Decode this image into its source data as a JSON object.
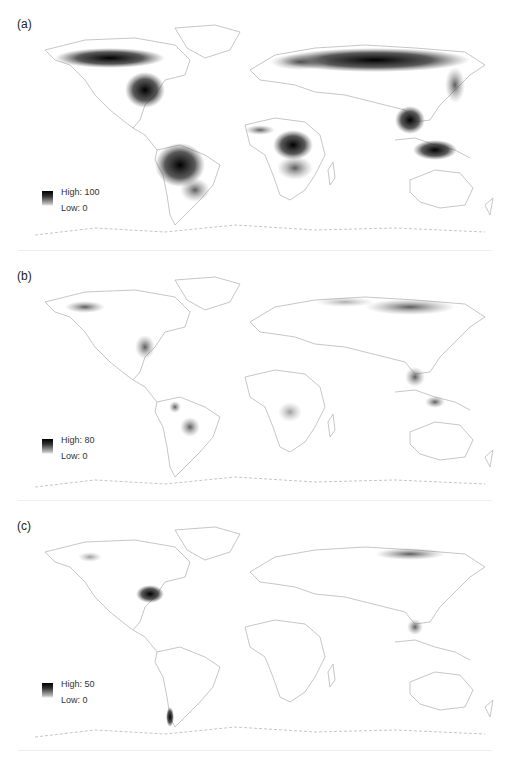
{
  "figure": {
    "panels": [
      {
        "label": "(a)",
        "legend": {
          "high": "High: 100",
          "low": "Low: 0"
        },
        "description": "Dense coverage across boreal North America and Eurasia, Amazon basin, Congo basin, Southeast Asia"
      },
      {
        "label": "(b)",
        "legend": {
          "high": "High: 80",
          "low": "Low: 0"
        },
        "description": "Sparse coverage; darker patches in eastern USA, northern South America, Siberia, Southeast Asia"
      },
      {
        "label": "(c)",
        "legend": {
          "high": "High: 50",
          "low": "Low: 0"
        },
        "description": "Sparse coverage; darkest in southeastern USA, southern Chile, scattered Siberia and Southeast Asia"
      }
    ],
    "colors": {
      "high": "#000000",
      "low": "#ffffff",
      "coast": "#b0b0b0"
    }
  }
}
